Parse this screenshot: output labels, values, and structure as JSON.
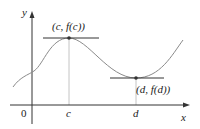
{
  "diagram": {
    "type": "function-graph-local-extrema",
    "axes": {
      "x_label": "x",
      "y_label": "y",
      "origin_label": "0"
    },
    "points": {
      "max": {
        "label": "(c, f(c))",
        "x_tick": "c"
      },
      "min": {
        "label": "(d, f(d))",
        "x_tick": "d"
      }
    },
    "colors": {
      "axis": "#333333",
      "curve": "#8a8a8a",
      "tangent": "#333333",
      "guide": "#bdbdbd",
      "point": "#333333"
    }
  }
}
